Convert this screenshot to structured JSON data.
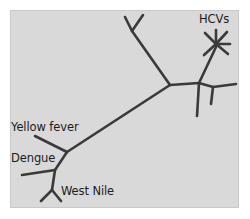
{
  "figure": {
    "type": "phylogenetic-tree",
    "rooted": false,
    "panel_background": "#d9d9d9",
    "branch_color": "#3a3a3a",
    "label_color": "#1c1c1c"
  },
  "labels": {
    "hcvs": "HCVs",
    "yellow_fever": "Yellow fever",
    "dengue": "Dengue",
    "west_nile": "West Nile"
  },
  "tree_data": {
    "type": "unrooted-phylogram",
    "taxa": [
      "HCVs",
      "Yellow fever",
      "Dengue",
      "West Nile"
    ],
    "nodes": {
      "trunk_left_junction": [
        67,
        152
      ],
      "trunk_right_junction": [
        170,
        85
      ],
      "right_junction": [
        199,
        83
      ],
      "hcvs_center": [
        216,
        44
      ],
      "upper_fork_vertex": [
        132,
        31
      ],
      "dengue_junction": [
        55,
        170
      ],
      "westnile_vertex": [
        52,
        190
      ]
    },
    "edges": [
      {
        "name": "trunk",
        "from": [
          67,
          152
        ],
        "to": [
          170,
          85
        ]
      },
      {
        "name": "upper-fork-stem",
        "from": [
          170,
          85
        ],
        "to": [
          132,
          31
        ]
      },
      {
        "name": "upper-fork-left-tip",
        "from": [
          132,
          31
        ],
        "to": [
          125,
          17
        ]
      },
      {
        "name": "upper-fork-right-tip",
        "from": [
          132,
          31
        ],
        "to": [
          143,
          15
        ]
      },
      {
        "name": "right-internal",
        "from": [
          170,
          85
        ],
        "to": [
          199,
          83
        ]
      },
      {
        "name": "right-pendant-down",
        "from": [
          199,
          83
        ],
        "to": [
          197,
          116
        ]
      },
      {
        "name": "right-subfork-stem",
        "from": [
          199,
          83
        ],
        "to": [
          213,
          87
        ]
      },
      {
        "name": "right-subfork-upper-tip",
        "from": [
          213,
          87
        ],
        "to": [
          236,
          84
        ]
      },
      {
        "name": "right-subfork-lower-tip",
        "from": [
          213,
          87
        ],
        "to": [
          211,
          104
        ]
      },
      {
        "name": "hcvs-stem",
        "from": [
          199,
          83
        ],
        "to": [
          216,
          47
        ]
      },
      {
        "name": "hcvs-ray-1",
        "from": [
          216,
          44
        ],
        "to": [
          205,
          33
        ]
      },
      {
        "name": "hcvs-ray-2",
        "from": [
          216,
          44
        ],
        "to": [
          216,
          30
        ]
      },
      {
        "name": "hcvs-ray-3",
        "from": [
          216,
          44
        ],
        "to": [
          227,
          32
        ]
      },
      {
        "name": "hcvs-ray-4",
        "from": [
          216,
          44
        ],
        "to": [
          230,
          44
        ]
      },
      {
        "name": "hcvs-ray-5",
        "from": [
          216,
          44
        ],
        "to": [
          228,
          54
        ]
      },
      {
        "name": "hcvs-ray-6",
        "from": [
          216,
          44
        ],
        "to": [
          204,
          55
        ]
      },
      {
        "name": "yellow-fever-branch",
        "from": [
          67,
          152
        ],
        "to": [
          35,
          136
        ]
      },
      {
        "name": "dengue-stem",
        "from": [
          67,
          152
        ],
        "to": [
          55,
          170
        ]
      },
      {
        "name": "dengue-branch",
        "from": [
          55,
          170
        ],
        "to": [
          22,
          175
        ]
      },
      {
        "name": "westnile-stem",
        "from": [
          55,
          170
        ],
        "to": [
          52,
          190
        ]
      },
      {
        "name": "westnile-tip-left",
        "from": [
          52,
          190
        ],
        "to": [
          41,
          201
        ]
      },
      {
        "name": "westnile-tip-right",
        "from": [
          52,
          190
        ],
        "to": [
          61,
          201
        ]
      }
    ],
    "label_anchors": {
      "HCVs": [
        199,
        14
      ],
      "Yellow fever": [
        11,
        122
      ],
      "Dengue": [
        11,
        153
      ],
      "West Nile": [
        61,
        186
      ]
    }
  }
}
